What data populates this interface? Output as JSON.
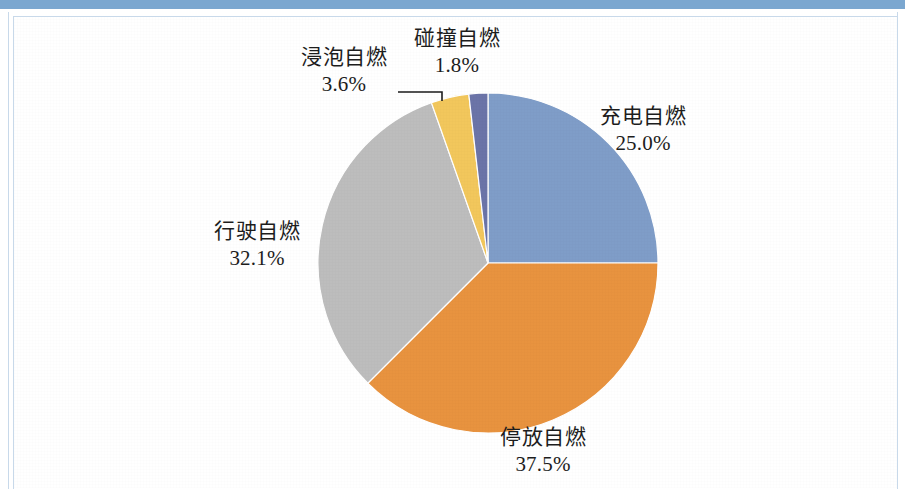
{
  "figure": {
    "background_color": "#ffffff",
    "top_bar_color": "#7ba7d0",
    "frame_color": "#c8d9ea",
    "label_text_color": "#1d1d1d"
  },
  "chart_data": {
    "type": "pie",
    "title": "",
    "subtitle": "",
    "xlabel": "",
    "ylabel": "",
    "legend_position": "none",
    "grid": false,
    "start_angle_deg": 0,
    "direction": "clockwise",
    "labels_show_name_and_percent": true,
    "categories": [
      "充电自燃",
      "停放自燃",
      "行驶自燃",
      "浸泡自燃",
      "碰撞自燃"
    ],
    "values": [
      25.0,
      37.5,
      32.1,
      3.6,
      1.8
    ],
    "value_unit": "%",
    "colors": [
      "#7f9dc8",
      "#e8933f",
      "#bdbdbd",
      "#f2c75c",
      "#6b74a8"
    ],
    "slices": [
      {
        "label": "充电自燃",
        "percent_text": "25.0%",
        "value": 25.0,
        "color": "#7f9dc8"
      },
      {
        "label": "停放自燃",
        "percent_text": "37.5%",
        "value": 37.5,
        "color": "#e8933f"
      },
      {
        "label": "行驶自燃",
        "percent_text": "32.1%",
        "value": 32.1,
        "color": "#bdbdbd"
      },
      {
        "label": "浸泡自燃",
        "percent_text": "3.6%",
        "value": 3.6,
        "color": "#f2c75c"
      },
      {
        "label": "碰撞自燃",
        "percent_text": "1.8%",
        "value": 1.8,
        "color": "#6b74a8"
      }
    ]
  }
}
